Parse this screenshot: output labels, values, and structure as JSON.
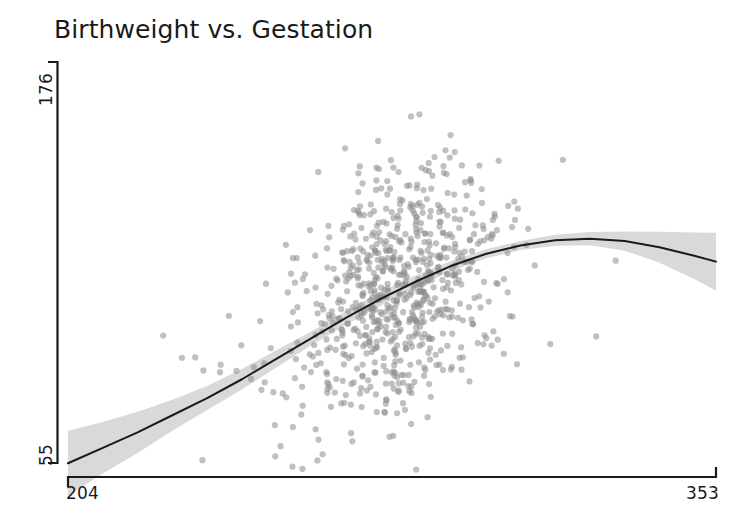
{
  "chart_data": {
    "type": "scatter",
    "title": "Birthweight vs. Gestation",
    "xlabel": "",
    "ylabel": "",
    "xlim": [
      204,
      353
    ],
    "ylim": [
      55,
      176
    ],
    "x_ticks": [
      204,
      353
    ],
    "y_ticks": [
      55,
      176
    ],
    "x_tick_labels": [
      "204",
      "353"
    ],
    "y_tick_labels": [
      "55",
      "176"
    ],
    "grid": false,
    "legend": "none",
    "point_color": "#8c8c8c",
    "point_opacity": 0.55,
    "point_radius": 3.1,
    "smoother": {
      "name": "loess-fit",
      "color": "#1a1a1a",
      "line_width": 2.0,
      "band_color": "#d9d9d9",
      "band_name": "confidence-band",
      "x": [
        204,
        212,
        220,
        228,
        236,
        244,
        252,
        260,
        268,
        276,
        284,
        292,
        300,
        308,
        316,
        324,
        332,
        340,
        348,
        353
      ],
      "y": [
        59.0,
        63.5,
        68.0,
        73.0,
        78.0,
        83.5,
        89.5,
        95.5,
        101.5,
        107.0,
        112.0,
        116.5,
        120.0,
        122.5,
        124.0,
        124.5,
        123.8,
        122.0,
        119.5,
        117.8
      ],
      "y_upper": [
        68.5,
        71.0,
        74.0,
        77.5,
        81.5,
        86.5,
        92.0,
        97.5,
        103.5,
        109.0,
        113.8,
        118.0,
        121.3,
        123.8,
        125.6,
        126.4,
        126.6,
        126.5,
        126.3,
        126.2
      ],
      "y_lower": [
        49.5,
        56.0,
        62.0,
        68.5,
        74.5,
        80.5,
        87.0,
        93.5,
        99.5,
        105.0,
        110.2,
        115.0,
        118.7,
        121.2,
        122.4,
        122.6,
        121.0,
        117.5,
        112.7,
        109.4
      ]
    },
    "series": [
      {
        "name": "births",
        "n_points": 760,
        "x_mean": 280,
        "y_mean": 118,
        "description": "Individual birth records: gestation period (days) on x-axis, birthweight on y-axis; dense overplotted core near x=275-295, y=105-145."
      }
    ]
  },
  "axes": {
    "x_min_label": "204",
    "x_max_label": "353",
    "y_min_label": "55",
    "y_max_label": "176",
    "axis_color": "#1a1a1a"
  },
  "title": {
    "text": "Birthweight vs. Gestation"
  }
}
